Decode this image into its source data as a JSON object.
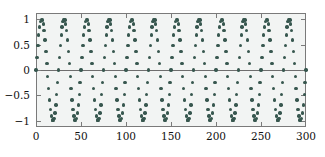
{
  "chart_data": {
    "type": "scatter",
    "title": "",
    "xlabel": "",
    "ylabel": "",
    "xlim": [
      0,
      300
    ],
    "ylim": [
      -1.12,
      1.12
    ],
    "grid": false,
    "legend": null,
    "marker": {
      "shape": "circle",
      "color": "#37574f",
      "size_px": 3.4
    },
    "background_color": "#f2f4f3",
    "frame_color": "#7a7a7a",
    "zero_line": 0,
    "xticks": [
      0,
      50,
      100,
      150,
      200,
      250,
      300
    ],
    "xticklabels": [
      "0",
      "50",
      "100",
      "150",
      "200",
      "250",
      "300"
    ],
    "yticks": [
      1,
      0.5,
      0,
      -0.5,
      -1
    ],
    "yticklabels": [
      "1",
      "0.5",
      "0",
      "-0.5",
      "-1"
    ],
    "n_points": 301,
    "series": [
      {
        "name": "signal",
        "x": [
          0,
          1,
          2,
          3,
          4,
          5,
          6,
          7,
          8,
          9,
          10,
          11,
          12,
          13,
          14,
          15,
          16,
          17,
          18,
          19,
          20,
          21,
          22,
          23,
          24,
          25,
          26,
          27,
          28,
          29,
          30,
          31,
          32,
          33,
          34,
          35,
          36,
          37,
          38,
          39,
          40,
          41,
          42,
          43,
          44,
          45,
          46,
          47,
          48,
          49,
          50,
          51,
          52,
          53,
          54,
          55,
          56,
          57,
          58,
          59,
          60,
          61,
          62,
          63,
          64,
          65,
          66,
          67,
          68,
          69,
          70,
          71,
          72,
          73,
          74,
          75,
          76,
          77,
          78,
          79,
          80,
          81,
          82,
          83,
          84,
          85,
          86,
          87,
          88,
          89,
          90,
          91,
          92,
          93,
          94,
          95,
          96,
          97,
          98,
          99,
          100,
          101,
          102,
          103,
          104,
          105,
          106,
          107,
          108,
          109,
          110,
          111,
          112,
          113,
          114,
          115,
          116,
          117,
          118,
          119,
          120,
          121,
          122,
          123,
          124,
          125,
          126,
          127,
          128,
          129,
          130,
          131,
          132,
          133,
          134,
          135,
          136,
          137,
          138,
          139,
          140,
          141,
          142,
          143,
          144,
          145,
          146,
          147,
          148,
          149,
          150,
          151,
          152,
          153,
          154,
          155,
          156,
          157,
          158,
          159,
          160,
          161,
          162,
          163,
          164,
          165,
          166,
          167,
          168,
          169,
          170,
          171,
          172,
          173,
          174,
          175,
          176,
          177,
          178,
          179,
          180,
          181,
          182,
          183,
          184,
          185,
          186,
          187,
          188,
          189,
          190,
          191,
          192,
          193,
          194,
          195,
          196,
          197,
          198,
          199,
          200,
          201,
          202,
          203,
          204,
          205,
          206,
          207,
          208,
          209,
          210,
          211,
          212,
          213,
          214,
          215,
          216,
          217,
          218,
          219,
          220,
          221,
          222,
          223,
          224,
          225,
          226,
          227,
          228,
          229,
          230,
          231,
          232,
          233,
          234,
          235,
          236,
          237,
          238,
          239,
          240,
          241,
          242,
          243,
          244,
          245,
          246,
          247,
          248,
          249,
          250,
          251,
          252,
          253,
          254,
          255,
          256,
          257,
          258,
          259,
          260,
          261,
          262,
          263,
          264,
          265,
          266,
          267,
          268,
          269,
          270,
          271,
          272,
          273,
          274,
          275,
          276,
          277,
          278,
          279,
          280,
          281,
          282,
          283,
          284,
          285,
          286,
          287,
          288,
          289,
          290,
          291,
          292,
          293,
          294,
          295,
          296,
          297,
          298,
          299,
          300
        ],
        "formula": "sin(2*pi*x/25)"
      }
    ]
  }
}
